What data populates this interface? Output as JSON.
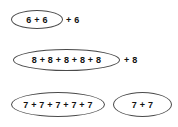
{
  "page": {
    "background_color": "#ffffff",
    "ellipse_stroke_color": "#4a4a4a",
    "text_color": "#111111",
    "width": 178,
    "height": 127
  },
  "rows": [
    {
      "id": "row-1",
      "groups": [
        {
          "expression": "6 + 6"
        }
      ],
      "trailing_term": "+ 6"
    },
    {
      "id": "row-2",
      "groups": [
        {
          "expression": "8 + 8 + 8 + 8 + 8"
        }
      ],
      "trailing_term": "+ 8"
    },
    {
      "id": "row-3",
      "groups": [
        {
          "expression": "7 + 7 + 7 + 7 + 7"
        },
        {
          "expression": "7 + 7"
        }
      ],
      "trailing_term": ""
    }
  ]
}
